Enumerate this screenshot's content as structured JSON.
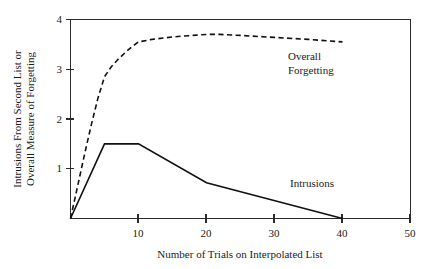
{
  "chart_data": {
    "type": "line",
    "title": "",
    "xlabel": "Number of Trials on Interpolated List",
    "ylabel_line1": "Intrusions From Second List or",
    "ylabel_line2": "Overall Measure of Forgetting",
    "xlim": [
      0,
      50
    ],
    "ylim": [
      0,
      4
    ],
    "xticks": [
      10,
      20,
      30,
      40,
      50
    ],
    "xtick_labels": [
      "10",
      "20",
      "30",
      "40",
      "50"
    ],
    "yticks": [
      1,
      2,
      3,
      4
    ],
    "ytick_labels": [
      "1",
      "2",
      "3",
      "4"
    ],
    "grid": false,
    "legend_position": "inline-annotation",
    "series": [
      {
        "name": "Overall Forgetting",
        "style": "dashed",
        "annotation_line1": "Overall",
        "annotation_line2": "Forgetting",
        "x": [
          0,
          1,
          2,
          3,
          4,
          5,
          6,
          7,
          8,
          9,
          10,
          12,
          15,
          18,
          20,
          22,
          25,
          30,
          35,
          40
        ],
        "values": [
          0,
          0.62,
          1.25,
          1.85,
          2.4,
          2.85,
          3.05,
          3.2,
          3.33,
          3.45,
          3.55,
          3.6,
          3.65,
          3.68,
          3.7,
          3.7,
          3.68,
          3.64,
          3.6,
          3.55
        ]
      },
      {
        "name": "Intrusions",
        "style": "solid",
        "annotation_line1": "Intrusions",
        "annotation_line2": "",
        "x": [
          0,
          5,
          10,
          20,
          40
        ],
        "values": [
          0,
          1.5,
          1.5,
          0.72,
          0
        ]
      }
    ]
  },
  "annotations": {
    "overall_forgetting": {
      "line1": "Overall",
      "line2": "Forgetting"
    },
    "intrusions": {
      "line1": "Intrusions"
    }
  }
}
